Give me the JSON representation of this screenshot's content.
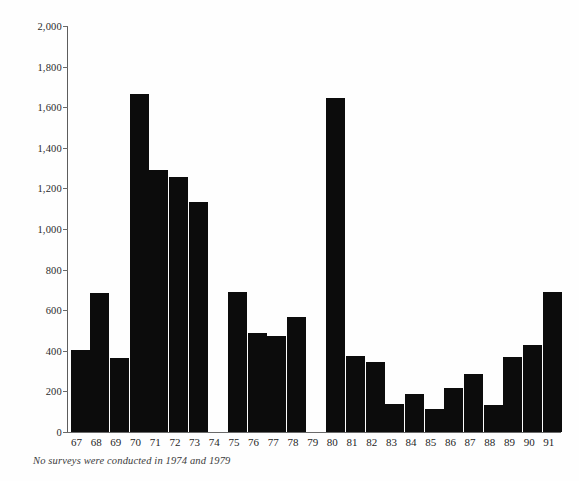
{
  "chart_data": {
    "type": "bar",
    "title": "",
    "subtitle": "",
    "xlabel": "",
    "ylabel": "",
    "categories": [
      "67",
      "68",
      "69",
      "70",
      "71",
      "72",
      "73",
      "74",
      "75",
      "76",
      "77",
      "78",
      "79",
      "80",
      "81",
      "82",
      "83",
      "84",
      "85",
      "86",
      "87",
      "88",
      "89",
      "90",
      "91"
    ],
    "values": [
      405,
      685,
      365,
      1665,
      1290,
      1255,
      1135,
      null,
      690,
      490,
      475,
      565,
      null,
      1645,
      375,
      345,
      140,
      185,
      115,
      215,
      285,
      135,
      368,
      428,
      690
    ],
    "missing_categories": [
      "74",
      "79"
    ],
    "ylim": [
      0,
      2000
    ],
    "y_tick_step": 200,
    "y_tick_labels": [
      "0",
      "200",
      "400",
      "600",
      "800",
      "1,000",
      "1,200",
      "1,400",
      "1,600",
      "1,800",
      "2,000"
    ],
    "y_tick_values": [
      0,
      200,
      400,
      600,
      800,
      1000,
      1200,
      1400,
      1600,
      1800,
      2000
    ],
    "grid": false,
    "legend": null,
    "bar_color": "#0c0c0c",
    "background_color": "#ffffff",
    "axis_color": "#6a6a6a",
    "annotations": [
      "No surveys  were conducted in 1974 and 1979"
    ]
  },
  "figure": {
    "caption": "No surveys  were conducted in 1974 and 1979"
  }
}
